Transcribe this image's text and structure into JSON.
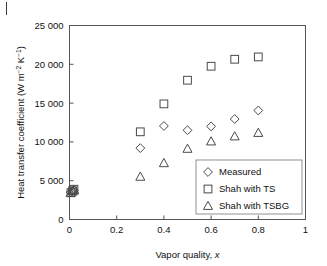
{
  "figure": {
    "background_color": "#ffffff",
    "marker_color": "#4a4a4a",
    "axis_color": "#555555"
  },
  "chart_data": {
    "type": "scatter",
    "title": "",
    "xlabel_text": "Vapor quality, ",
    "xlabel_italic": "x",
    "ylabel_text": "Heat transfer coefficient (W m",
    "ylabel_sup1": "−2",
    "ylabel_mid": " K",
    "ylabel_sup2": "−1",
    "ylabel_end": ")",
    "xlim": [
      0,
      1
    ],
    "ylim": [
      0,
      25000
    ],
    "xticks": [
      0,
      0.2,
      0.4,
      0.6,
      0.8,
      1
    ],
    "xticklabels": [
      "0",
      "0.2",
      "0.4",
      "0.6",
      "0.8",
      "1"
    ],
    "yticks": [
      0,
      5000,
      10000,
      15000,
      20000,
      25000
    ],
    "yticklabels": [
      "0",
      "5 000",
      "10 000",
      "15 000",
      "20 000",
      "25 000"
    ],
    "grid": false,
    "legend_position": "lower-right-inside",
    "series": [
      {
        "name": "Measured",
        "marker": "diamond",
        "x": [
          0.005,
          0.012,
          0.018,
          0.3,
          0.4,
          0.5,
          0.6,
          0.7,
          0.8
        ],
        "y": [
          3500,
          3650,
          3800,
          9200,
          12050,
          11500,
          12000,
          12950,
          14050
        ]
      },
      {
        "name": "Shah with TS",
        "marker": "square",
        "x": [
          0.006,
          0.013,
          0.019,
          0.3,
          0.4,
          0.5,
          0.6,
          0.7,
          0.8
        ],
        "y": [
          3450,
          3700,
          3900,
          11300,
          14900,
          17950,
          19750,
          20650,
          20950
        ]
      },
      {
        "name": "Shah with TSBG",
        "marker": "triangle",
        "x": [
          0.005,
          0.014,
          0.02,
          0.3,
          0.4,
          0.5,
          0.6,
          0.7,
          0.8
        ],
        "y": [
          3400,
          3600,
          3750,
          5500,
          7250,
          9100,
          10050,
          10700,
          11150
        ]
      }
    ]
  },
  "legend": {
    "entries": [
      {
        "label": "Measured",
        "marker": "diamond"
      },
      {
        "label": "Shah with TS",
        "marker": "square"
      },
      {
        "label": "Shah with TSBG",
        "marker": "triangle"
      }
    ]
  }
}
